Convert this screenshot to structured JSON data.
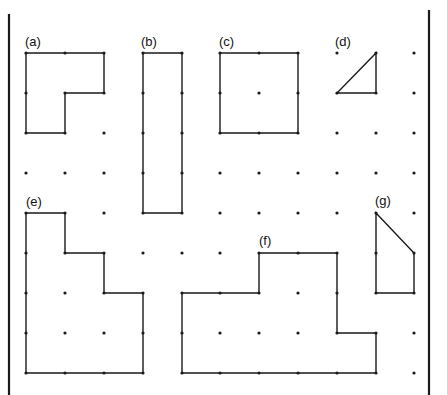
{
  "canvas": {
    "width": 447,
    "height": 395,
    "background": "#ffffff",
    "ink": "#1a1a1a"
  },
  "frame": {
    "left_bar": {
      "x": 9,
      "y1": 14,
      "y2": 395
    },
    "right_bar": {
      "x": 429,
      "y1": 10,
      "y2": 395
    }
  },
  "grid": {
    "cols_x": [
      26,
      65,
      104,
      143,
      182,
      220,
      259,
      298,
      337,
      376,
      414
    ],
    "rows_y": [
      53,
      93,
      133,
      173,
      213,
      253,
      293,
      333,
      373
    ],
    "dot_radius": 1.6
  },
  "shapes": [
    {
      "id": "a",
      "label": "(a)",
      "label_pos": [
        25,
        46
      ],
      "points": [
        [
          0,
          0
        ],
        [
          2,
          0
        ],
        [
          2,
          1
        ],
        [
          1,
          1
        ],
        [
          1,
          2
        ],
        [
          0,
          2
        ]
      ]
    },
    {
      "id": "b",
      "label": "(b)",
      "label_pos": [
        141,
        46
      ],
      "points": [
        [
          3,
          0
        ],
        [
          4,
          0
        ],
        [
          4,
          4
        ],
        [
          3,
          4
        ]
      ]
    },
    {
      "id": "c",
      "label": "(c)",
      "label_pos": [
        219,
        46
      ],
      "points": [
        [
          5,
          0
        ],
        [
          7,
          0
        ],
        [
          7,
          2
        ],
        [
          5,
          2
        ]
      ]
    },
    {
      "id": "d",
      "label": "(d)",
      "label_pos": [
        335,
        46
      ],
      "points": [
        [
          9,
          0
        ],
        [
          9,
          1
        ],
        [
          8,
          1
        ]
      ]
    },
    {
      "id": "e",
      "label": "(e)",
      "label_pos": [
        26,
        206
      ],
      "points": [
        [
          0,
          4
        ],
        [
          1,
          4
        ],
        [
          1,
          5
        ],
        [
          2,
          5
        ],
        [
          2,
          6
        ],
        [
          3,
          6
        ],
        [
          3,
          8
        ],
        [
          0,
          8
        ]
      ]
    },
    {
      "id": "f",
      "label": "(f)",
      "label_pos": [
        259,
        245
      ],
      "points": [
        [
          4,
          6
        ],
        [
          6,
          6
        ],
        [
          6,
          5
        ],
        [
          8,
          5
        ],
        [
          8,
          7
        ],
        [
          9,
          7
        ],
        [
          9,
          8
        ],
        [
          4,
          8
        ]
      ]
    },
    {
      "id": "g",
      "label": "(g)",
      "label_pos": [
        375,
        205
      ],
      "points": [
        [
          9,
          4
        ],
        [
          10,
          5
        ],
        [
          10,
          6
        ],
        [
          9,
          6
        ]
      ]
    }
  ]
}
